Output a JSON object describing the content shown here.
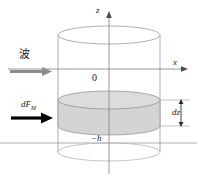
{
  "figure": {
    "type": "physics-schematic",
    "background_color": "#ffffff"
  },
  "axes": {
    "vertical": {
      "label": "z",
      "direction": "up",
      "arrow": true
    },
    "horizontal": {
      "label": "x",
      "direction": "right",
      "arrow": true
    },
    "origin_label": "0",
    "seabed_label": "−h"
  },
  "annotations": {
    "wave_label": "波",
    "wave_arrow_color": "#8c8c8c",
    "force_label_base": "dF",
    "force_label_sub": "M",
    "force_arrow_color": "#000000",
    "slab_label": "dz"
  },
  "geometry": {
    "cylinder_fill": "#ffffff",
    "cylinder_stroke": "#9a9a9a",
    "slab_fill": "#d4d4d4",
    "slab_stroke": "#8a8a8a",
    "axis_stroke": "#8d8d8d"
  }
}
